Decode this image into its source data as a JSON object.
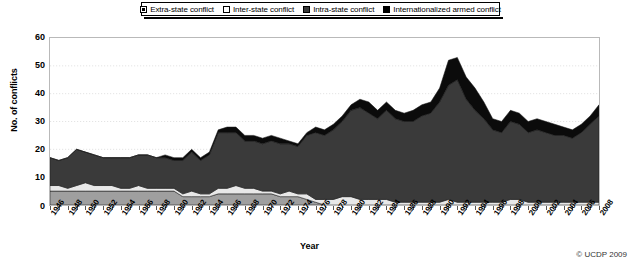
{
  "legend": {
    "position": "top-center",
    "items": [
      {
        "label": "Extra-state conflict",
        "swatch": "square-white-dot",
        "color": "#ffffff"
      },
      {
        "label": "Inter-state conflict",
        "swatch": "square-white",
        "color": "#ffffff"
      },
      {
        "label": "Intra-state conflict",
        "swatch": "square-dark-gray",
        "color": "#3a3a3a"
      },
      {
        "label": "Internationalized armed conflict",
        "swatch": "square-black",
        "color": "#000000"
      }
    ]
  },
  "axes": {
    "ylabel": "No. of conflicts",
    "xlabel": "Year",
    "yticks": [
      "60",
      "50",
      "40",
      "30",
      "20",
      "10",
      "0"
    ],
    "ylim": [
      0,
      60
    ],
    "xtick_labels": [
      "1946",
      "1948",
      "1950",
      "1952",
      "1954",
      "1956",
      "1958",
      "1960",
      "1962",
      "1964",
      "1966",
      "1968",
      "1970",
      "1972",
      "1974",
      "1976",
      "1978",
      "1980",
      "1982",
      "1984",
      "1986",
      "1988",
      "1990",
      "1992",
      "1994",
      "1996",
      "1998",
      "2000",
      "2002",
      "2004",
      "2006",
      "2008"
    ]
  },
  "credit": "© UCDP 2009",
  "chart_data": {
    "type": "area",
    "stacked": true,
    "title": "",
    "xlabel": "Year",
    "ylabel": "No. of conflicts",
    "ylim": [
      0,
      60
    ],
    "grid": true,
    "legend_position": "top-center",
    "x": [
      1946,
      1947,
      1948,
      1949,
      1950,
      1951,
      1952,
      1953,
      1954,
      1955,
      1956,
      1957,
      1958,
      1959,
      1960,
      1961,
      1962,
      1963,
      1964,
      1965,
      1966,
      1967,
      1968,
      1969,
      1970,
      1971,
      1972,
      1973,
      1974,
      1975,
      1976,
      1977,
      1978,
      1979,
      1980,
      1981,
      1982,
      1983,
      1984,
      1985,
      1986,
      1987,
      1988,
      1989,
      1990,
      1991,
      1992,
      1993,
      1994,
      1995,
      1996,
      1997,
      1998,
      1999,
      2000,
      2001,
      2002,
      2003,
      2004,
      2005,
      2006,
      2007,
      2008
    ],
    "series": [
      {
        "name": "Extra-state conflict",
        "color": "#9f9f9f",
        "values": [
          5,
          5,
          5,
          5,
          5,
          5,
          5,
          5,
          5,
          5,
          5,
          5,
          5,
          5,
          5,
          3,
          3,
          3,
          3,
          4,
          4,
          4,
          4,
          4,
          4,
          4,
          3,
          3,
          3,
          2,
          1,
          0,
          0,
          0,
          0,
          0,
          0,
          0,
          0,
          0,
          0,
          0,
          0,
          0,
          0,
          0,
          0,
          0,
          0,
          0,
          0,
          0,
          0,
          0,
          0,
          0,
          0,
          0,
          0,
          0,
          0,
          0,
          0
        ]
      },
      {
        "name": "Inter-state conflict",
        "color": "#e8e8e8",
        "values": [
          2,
          2,
          1,
          2,
          3,
          2,
          2,
          2,
          1,
          1,
          2,
          1,
          1,
          1,
          1,
          1,
          2,
          1,
          1,
          2,
          2,
          3,
          2,
          2,
          1,
          1,
          1,
          2,
          1,
          2,
          1,
          2,
          2,
          3,
          3,
          2,
          2,
          2,
          2,
          1,
          1,
          1,
          1,
          1,
          1,
          2,
          1,
          1,
          1,
          1,
          1,
          1,
          2,
          2,
          1,
          1,
          1,
          1,
          1,
          1,
          1,
          1,
          1
        ]
      },
      {
        "name": "Intra-state conflict",
        "color": "#3a3a3a",
        "values": [
          10,
          9,
          11,
          13,
          11,
          11,
          10,
          10,
          11,
          11,
          11,
          12,
          11,
          11,
          10,
          12,
          14,
          12,
          14,
          20,
          20,
          19,
          17,
          17,
          17,
          18,
          18,
          17,
          17,
          21,
          24,
          23,
          25,
          27,
          31,
          33,
          31,
          29,
          32,
          30,
          29,
          29,
          31,
          32,
          36,
          41,
          44,
          37,
          33,
          30,
          26,
          25,
          28,
          27,
          25,
          26,
          25,
          24,
          24,
          23,
          25,
          28,
          31
        ]
      },
      {
        "name": "Internationalized armed conflict",
        "color": "#0b0b0b",
        "values": [
          0,
          0,
          0,
          0,
          0,
          0,
          0,
          0,
          0,
          0,
          0,
          0,
          0,
          1,
          1,
          1,
          1,
          1,
          1,
          1,
          2,
          2,
          2,
          2,
          2,
          2,
          2,
          1,
          1,
          1,
          2,
          2,
          2,
          2,
          2,
          3,
          4,
          3,
          3,
          3,
          3,
          4,
          4,
          4,
          5,
          9,
          8,
          8,
          8,
          6,
          4,
          4,
          4,
          4,
          4,
          4,
          4,
          4,
          3,
          3,
          3,
          3,
          4
        ]
      }
    ],
    "totals": [
      17,
      16,
      17,
      20,
      19,
      18,
      17,
      17,
      17,
      17,
      18,
      18,
      17,
      18,
      17,
      17,
      20,
      17,
      19,
      27,
      28,
      28,
      25,
      25,
      24,
      25,
      24,
      23,
      22,
      26,
      28,
      27,
      29,
      32,
      36,
      38,
      37,
      34,
      37,
      34,
      33,
      34,
      36,
      37,
      42,
      52,
      53,
      46,
      42,
      37,
      31,
      30,
      34,
      33,
      30,
      31,
      30,
      29,
      28,
      27,
      29,
      32,
      36
    ]
  }
}
